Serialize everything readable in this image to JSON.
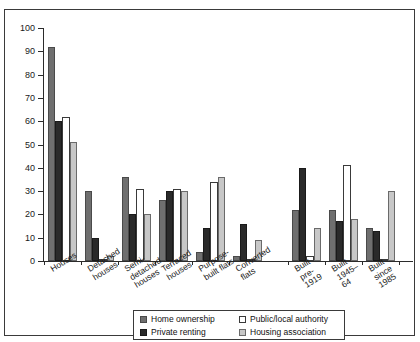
{
  "chart_data": {
    "type": "bar",
    "title": "",
    "xlabel": "",
    "ylabel": "",
    "ylim": [
      0,
      100
    ],
    "ytick_step": 10,
    "yticks": [
      0,
      10,
      20,
      30,
      40,
      50,
      60,
      70,
      80,
      90,
      100
    ],
    "grid": false,
    "legend_position": "bottom-center",
    "categories": [
      "Houses",
      "Detached houses",
      "Semi-detached houses",
      "Terraced houses",
      "Purpose-built flats",
      "Converted flats",
      "Built pre-1919",
      "Built 1945–64",
      "Built since 1985"
    ],
    "category_label_lines": [
      [
        "Houses"
      ],
      [
        "Detached",
        "houses"
      ],
      [
        "Semi-",
        "detached",
        "houses"
      ],
      [
        "Terraced",
        "houses"
      ],
      [
        "Purpose-",
        "built flats"
      ],
      [
        "Converted",
        "flats"
      ],
      [
        "Built pre-",
        "1919"
      ],
      [
        "Built",
        "1945–64"
      ],
      [
        "Built since",
        "1985"
      ]
    ],
    "group_gap_after_index": 5,
    "series": [
      {
        "name": "Home ownership",
        "color": "#6f6f6f",
        "values": [
          92,
          30,
          36,
          26,
          4,
          2,
          22,
          22,
          14
        ]
      },
      {
        "name": "Private renting",
        "color": "#2a2a2a",
        "values": [
          60,
          10,
          20,
          30,
          14,
          16,
          40,
          17,
          13
        ]
      },
      {
        "name": "Public/local authority",
        "color": "#ffffff",
        "values": [
          62,
          1,
          31,
          31,
          34,
          1,
          2,
          41,
          1
        ]
      },
      {
        "name": "Housing association",
        "color": "#c7c7c7",
        "values": [
          51,
          2,
          20,
          30,
          36,
          9,
          14,
          18,
          30
        ]
      }
    ]
  },
  "legend": {
    "entries": [
      {
        "label": "Home ownership",
        "swatch": "mid-grey"
      },
      {
        "label": "Public/local authority",
        "swatch": "white"
      },
      {
        "label": "Private renting",
        "swatch": "dark"
      },
      {
        "label": "Housing association",
        "swatch": "light-grey"
      }
    ]
  }
}
